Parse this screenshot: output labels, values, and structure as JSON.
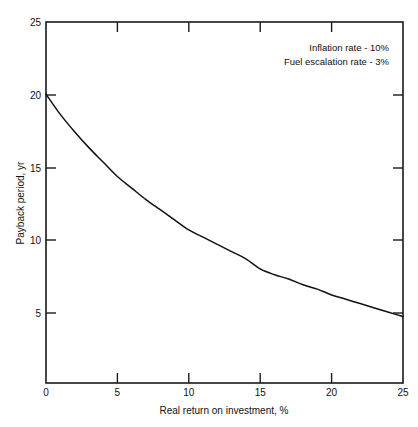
{
  "chart_data": {
    "type": "line",
    "title": "",
    "xlabel": "Real return on investment, %",
    "ylabel": "Payback period, yr",
    "xlim": [
      0,
      25
    ],
    "ylim": [
      0,
      25
    ],
    "xticks": [
      0,
      5,
      10,
      15,
      20,
      25
    ],
    "yticks": [
      5,
      10,
      15,
      20,
      25
    ],
    "xtick_labels": [
      "0",
      "5",
      "10",
      "15",
      "20",
      "25"
    ],
    "ytick_labels": [
      "5",
      "10",
      "15",
      "20",
      "25"
    ],
    "grid": false,
    "legend": null,
    "legend_position": "none",
    "tick_direction": "in",
    "frame": "box",
    "series": [
      {
        "name": "Payback period",
        "x": [
          0,
          1,
          2,
          3,
          4,
          5,
          6,
          7,
          8,
          9,
          10,
          11,
          12,
          13,
          14,
          15,
          16,
          17,
          18,
          19,
          20,
          21,
          22,
          23,
          24,
          25
        ],
        "y": [
          20.0,
          18.6,
          17.4,
          16.3,
          15.3,
          14.3,
          13.5,
          12.7,
          12.0,
          11.3,
          10.6,
          10.1,
          9.6,
          9.1,
          8.6,
          7.9,
          7.5,
          7.2,
          6.8,
          6.5,
          6.1,
          5.8,
          5.5,
          5.2,
          4.9,
          4.6
        ]
      }
    ],
    "annotations": [
      {
        "text": "Inflation rate - 10%",
        "x": 16.5,
        "y": 23.4
      },
      {
        "text": "Fuel escalation rate - 3%",
        "x": 16.0,
        "y": 22.2
      }
    ]
  },
  "colors": {
    "background": "#ffffff",
    "axis": "#1a1a1a",
    "curve": "#111111",
    "text": "#111111"
  }
}
